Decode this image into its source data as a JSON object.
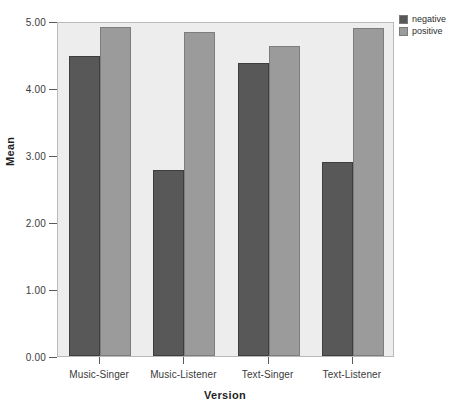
{
  "chart_data": {
    "type": "bar",
    "title": "",
    "xlabel": "Version",
    "ylabel": "Mean",
    "categories": [
      "Music-Singer",
      "Music-Listener",
      "Text-Singer",
      "Text-Listener"
    ],
    "series": [
      {
        "name": "negative",
        "color": "#585858",
        "values": [
          4.48,
          2.77,
          4.37,
          2.89
        ]
      },
      {
        "name": "positive",
        "color": "#9b9b9b",
        "values": [
          4.91,
          4.84,
          4.63,
          4.9
        ]
      }
    ],
    "ylim": [
      0.0,
      5.0
    ],
    "yticks": [
      0.0,
      1.0,
      2.0,
      3.0,
      4.0,
      5.0
    ],
    "ytick_labels": [
      "0.00",
      "1.00",
      "2.00",
      "3.00",
      "4.00",
      "5.00"
    ],
    "grid": false,
    "legend_position": "top-right",
    "plot_background": "#ededed",
    "figure_background": "#ffffff"
  },
  "legend": {
    "items": [
      {
        "label": "negative",
        "color": "#585858"
      },
      {
        "label": "positive",
        "color": "#9b9b9b"
      }
    ]
  },
  "axes": {
    "y_title": "Mean",
    "x_title": "Version"
  }
}
